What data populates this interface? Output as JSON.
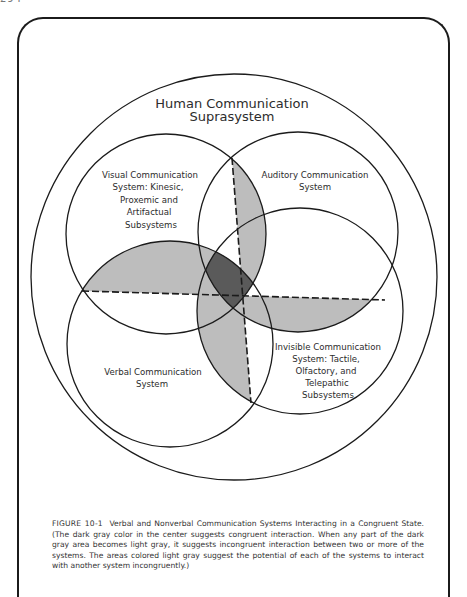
{
  "page": {
    "number": "294"
  },
  "diagram": {
    "title_line1": "Human Communication",
    "title_line2": "Suprasystem",
    "systems": {
      "visual": {
        "lines": [
          "Visual Communication",
          "System:  Kinesic,",
          "Proxemic and",
          "Artifactual",
          "Subsystems"
        ]
      },
      "auditory": {
        "lines": [
          "Auditory Communication",
          "System"
        ]
      },
      "verbal": {
        "lines": [
          "Verbal Communication",
          "System"
        ]
      },
      "invisible": {
        "lines": [
          "Invisible Communication",
          "System:  Tactile,",
          "Olfactory, and",
          "Telepathic",
          "Subsystems"
        ]
      }
    },
    "colors": {
      "dark_gray": "#5a5a5a",
      "light_gray": "#bdbdbd",
      "line": "#1b1b1b"
    }
  },
  "caption": {
    "figure_label": "FIGURE 10-1",
    "text": "Verbal and Nonverbal Communication Systems Interacting in a Congruent State. (The dark gray color in the center suggests congruent interaction. When any part of the dark gray area becomes light gray, it suggests incongruent interaction between two or more of the systems. The areas colored light gray suggest the potential of each of the systems to interact with another system incongruently.)"
  }
}
